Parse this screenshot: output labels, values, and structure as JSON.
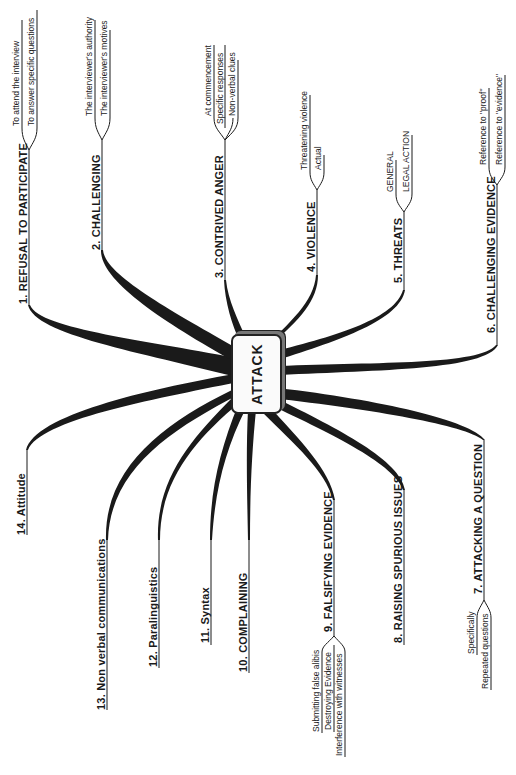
{
  "center": {
    "label": "ATTACK"
  },
  "branches": [
    {
      "label": "1.  REFUSAL TO PARTICIPATE",
      "children": [
        "To attend the interview",
        "To answer specific questions"
      ]
    },
    {
      "label": "2.  CHALLENGING",
      "children": [
        "The interviewer's authority",
        "The interviewer's motives"
      ]
    },
    {
      "label": "3.  CONTRIVED ANGER",
      "children": [
        "At commencement",
        "Specific responses",
        "Non-verbal clues"
      ]
    },
    {
      "label": "4.  VIOLENCE",
      "children": [
        "Threatening violence",
        "Actual"
      ]
    },
    {
      "label": "5.  THREATS",
      "children": [
        "GENERAL",
        "LEGAL ACTION"
      ]
    },
    {
      "label": "6.  CHALLENGING EVIDENCE",
      "children": [
        "Reference to \"proof\"",
        "Reference to \"evidence\""
      ]
    },
    {
      "label": "7.  ATTACKING A QUESTION",
      "children": [
        "Specifically",
        "Repeated questions"
      ]
    },
    {
      "label": "8.  RAISING SPURIOUS ISSUES",
      "children": []
    },
    {
      "label": "9.  FALSIFYING EVIDENCE",
      "children": [
        "Submitting false alibis",
        "Destroying Evidence",
        "Interference with witnesses"
      ]
    },
    {
      "label": "10.  COMPLAINING",
      "children": []
    },
    {
      "label": "11.  Syntax",
      "children": []
    },
    {
      "label": "12.  Paralinguistics",
      "children": []
    },
    {
      "label": "13.  Non verbal communications",
      "children": []
    },
    {
      "label": "14.  Attitude",
      "children": []
    }
  ],
  "colors": {
    "ink": "#1a1a1a",
    "background": "#ffffff"
  }
}
